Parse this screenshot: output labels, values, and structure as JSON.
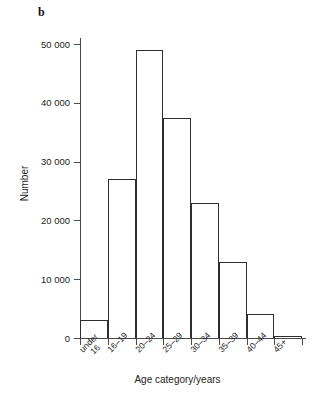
{
  "figure": {
    "panel_label": "b",
    "background_color": "#ffffff",
    "line_color": "#2e2e2e",
    "axis_color": "#4a4a4a"
  },
  "chart_data": {
    "type": "bar",
    "title": "",
    "subtitle": "",
    "panel": "b",
    "xlabel": "Age category/years",
    "ylabel": "Number",
    "categories": [
      "under 16",
      "16–19",
      "20–24",
      "25–29",
      "30–34",
      "35–39",
      "40–44",
      "45+"
    ],
    "category_lines": [
      [
        "under",
        "16"
      ],
      [
        "16–19"
      ],
      [
        "20–24"
      ],
      [
        "25–29"
      ],
      [
        "30–34"
      ],
      [
        "35–39"
      ],
      [
        "40–44"
      ],
      [
        "45+"
      ]
    ],
    "values": [
      3000,
      27000,
      49000,
      37500,
      23000,
      13000,
      4000,
      300
    ],
    "ylim": [
      0,
      50000
    ],
    "ytick_values": [
      0,
      10000,
      20000,
      30000,
      40000,
      50000
    ],
    "ytick_labels": [
      "0",
      "10 000",
      "20 000",
      "30 000",
      "40 000",
      "50 000"
    ],
    "grid": false,
    "legend": false,
    "bar_style": "outline",
    "bar_fill": "#ffffff",
    "bar_edge": "#2e2e2e"
  }
}
